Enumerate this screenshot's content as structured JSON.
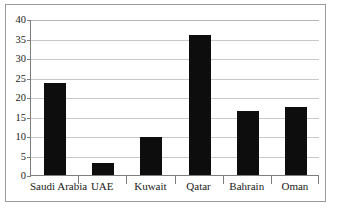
{
  "chart_data": {
    "type": "bar",
    "title": "",
    "subtitle": "",
    "xlabel": "",
    "ylabel": "",
    "categories": [
      "Saudi Arabia",
      "UAE",
      "Kuwait",
      "Qatar",
      "Bahrain",
      "Oman"
    ],
    "values": [
      23.5,
      3,
      9.7,
      36,
      16.5,
      17.5
    ],
    "series": [
      {
        "name": "",
        "values": [
          23.5,
          3,
          9.7,
          36,
          16.5,
          17.5
        ]
      }
    ],
    "ylim": [
      0,
      40
    ],
    "yticks": [
      0,
      5,
      10,
      15,
      20,
      25,
      30,
      35,
      40
    ],
    "ytick_labels": [
      "0",
      "5",
      "10",
      "15",
      "20",
      "25",
      "30",
      "35",
      "40"
    ],
    "grid": true,
    "grid_axis": "y",
    "legend": false,
    "legend_position": "none",
    "bar_color": "#0d0d0d",
    "grid_color": "#c8c8c8",
    "axis_color": "#7d7d7d",
    "frame_color": "#9a9a9a",
    "background": "#ffffff"
  }
}
